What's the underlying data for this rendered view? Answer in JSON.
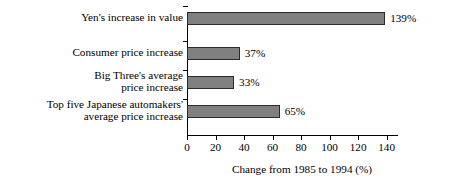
{
  "chart_data": {
    "type": "bar",
    "orientation": "horizontal",
    "title": "",
    "xlabel": "Change from 1985 to 1994 (%)",
    "ylabel": "",
    "xlim": [
      0,
      148
    ],
    "xticks": [
      0,
      20,
      40,
      60,
      80,
      100,
      120,
      140
    ],
    "xtick_labels": [
      "0",
      "20",
      "40",
      "60",
      "80",
      "100",
      "120",
      "140"
    ],
    "grid": false,
    "legend": null,
    "categories": [
      "Yen's increase in value",
      "Consumer price increase",
      "Big Three's average\nprice increase",
      "Top five Japanese automakers'\naverage price increase"
    ],
    "values": [
      139,
      37,
      33,
      65
    ],
    "data_labels": [
      "139%",
      "37%",
      "33%",
      "65%"
    ],
    "bar_color": "#808080",
    "bar_edge_color": "#2b2b2b",
    "background_color": "#ffffff",
    "text_color": "#000000"
  }
}
